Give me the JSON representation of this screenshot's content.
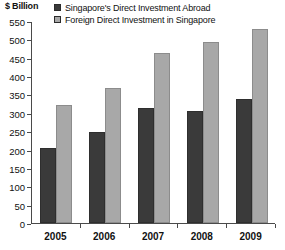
{
  "unit_label": "$ Billion",
  "legend": {
    "position": "top",
    "entries": [
      {
        "label": "Singapore's Direct Investment Abroad",
        "swatch": "dark-square-icon",
        "color": "#3a3a3a"
      },
      {
        "label": "Foreign Direct Investment in Singapore",
        "swatch": "light-square-icon",
        "color": "#a8a8a8"
      }
    ]
  },
  "chart_data": {
    "type": "bar",
    "title": "",
    "subtitle": "",
    "xlabel": "",
    "ylabel": "$ Billion",
    "categories": [
      "2005",
      "2006",
      "2007",
      "2008",
      "2009"
    ],
    "series": [
      {
        "name": "Singapore's Direct Investment Abroad",
        "color": "#3a3a3a",
        "values": [
          203,
          247,
          313,
          305,
          338
        ]
      },
      {
        "name": "Foreign Direct Investment in Singapore",
        "color": "#a8a8a8",
        "values": [
          320,
          367,
          463,
          494,
          529
        ]
      }
    ],
    "ylim": [
      0,
      550
    ],
    "ytick_step": 50,
    "yticks": [
      0,
      50,
      100,
      150,
      200,
      250,
      300,
      350,
      400,
      450,
      500,
      550
    ],
    "ytick_labels": [
      "0",
      "50",
      "100",
      "150",
      "200",
      "250",
      "300",
      "350",
      "400",
      "450",
      "500",
      "550"
    ],
    "grid": false,
    "legend_position": "top"
  }
}
